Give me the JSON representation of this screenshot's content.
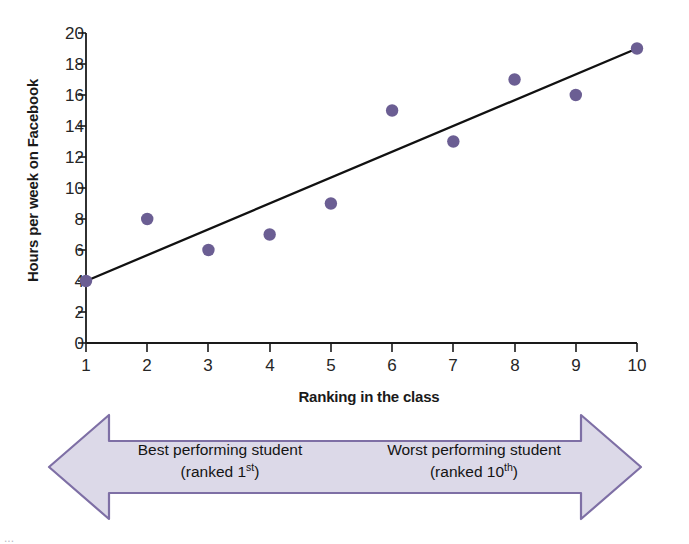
{
  "chart_data": {
    "type": "scatter",
    "title": "",
    "xlabel": "Ranking in the class",
    "ylabel": "Hours per week on Facebook",
    "xlim": [
      1,
      10
    ],
    "ylim": [
      0,
      20
    ],
    "grid": false,
    "legend": null,
    "x": [
      1,
      2,
      3,
      4,
      5,
      6,
      7,
      8,
      9,
      10
    ],
    "values": [
      4,
      8,
      6,
      7,
      9,
      15,
      13,
      17,
      16,
      19
    ],
    "points": [
      {
        "x": 1,
        "y": 4
      },
      {
        "x": 2,
        "y": 8
      },
      {
        "x": 3,
        "y": 6
      },
      {
        "x": 4,
        "y": 7
      },
      {
        "x": 5,
        "y": 9
      },
      {
        "x": 6,
        "y": 15
      },
      {
        "x": 7,
        "y": 13
      },
      {
        "x": 8,
        "y": 17
      },
      {
        "x": 9,
        "y": 16
      },
      {
        "x": 10,
        "y": 19
      }
    ],
    "trendline": {
      "type": "line",
      "from": {
        "x": 1,
        "y": 4
      },
      "to": {
        "x": 10,
        "y": 19
      }
    },
    "xticks": [
      "1",
      "2",
      "3",
      "4",
      "5",
      "6",
      "7",
      "8",
      "9",
      "10"
    ],
    "xtick_values": [
      1,
      2,
      3,
      4,
      5,
      6,
      7,
      8,
      9,
      10
    ],
    "yticks": [
      "0",
      "2",
      "4",
      "6",
      "8",
      "10",
      "12",
      "14",
      "16",
      "18",
      "20"
    ],
    "ytick_values": [
      0,
      2,
      4,
      6,
      8,
      10,
      12,
      14,
      16,
      18,
      20
    ],
    "marker_color": "#6b5e93",
    "line_color": "#111111",
    "axis_color": "#1a1a1a"
  },
  "banner": {
    "left_line1": "Best performing student",
    "left_line2_pre": "(ranked 1",
    "left_line2_sup": "st",
    "left_line2_post": ")",
    "right_line1": "Worst performing student",
    "right_line2_pre": "(ranked 10",
    "right_line2_sup": "th",
    "right_line2_post": ")",
    "fill_color": "#dcd9e8",
    "border_color": "#7e6fa5"
  },
  "caption": {
    "text": "..."
  }
}
